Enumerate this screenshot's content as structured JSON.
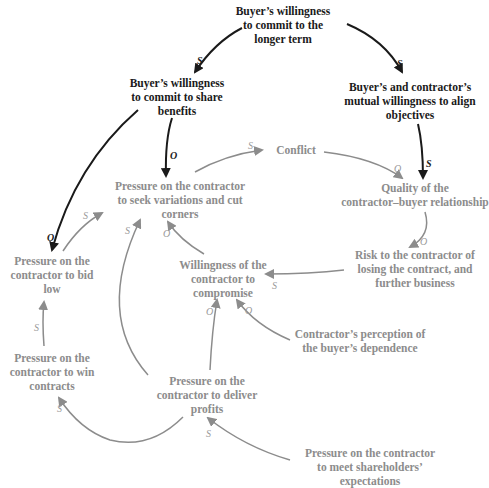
{
  "diagram": {
    "type": "causal-loop-diagram",
    "colors": {
      "dark": "#1a1a1a",
      "gray": "#8c8c8c"
    },
    "nodes": {
      "longer_term": "Buyer’s willingness to commit to the longer term",
      "share_benefits": "Buyer’s willingness to commit to share benefits",
      "align_objectives": "Buyer’s and contractor’s mutual willingness to align objectives",
      "conflict": "Conflict",
      "seek_variations": "Pressure on the contractor to seek variations and cut corners",
      "quality_relationship": "Quality of the contractor–buyer relationship",
      "risk_losing": "Risk to the contractor of losing the contract, and further business",
      "bid_low": "Pressure on the contractor to bid low",
      "willingness_compromise": "Willingness of the contractor to compromise",
      "perception_dependence": "Contractor’s perception of the buyer’s dependence",
      "win_contracts": "Pressure on the contractor to win contracts",
      "deliver_profits": "Pressure on the contractor to deliver profits",
      "shareholders": "Pressure on the contractor to meet shareholders’ expectations"
    },
    "node_lines": {
      "longer_term": [
        "Buyer’s willingness",
        "to commit to the",
        "longer term"
      ],
      "share_benefits": [
        "Buyer’s willingness",
        "to commit to share",
        "benefits"
      ],
      "align_objectives": [
        "Buyer’s and contractor’s",
        "mutual willingness to align",
        "objectives"
      ],
      "conflict": [
        "Conflict"
      ],
      "seek_variations": [
        "Pressure on the contractor",
        "to seek variations and cut",
        "corners"
      ],
      "quality_relationship": [
        "Quality of the",
        "contractor–buyer relationship"
      ],
      "risk_losing": [
        "Risk to the contractor of",
        "losing the contract, and",
        "further business"
      ],
      "bid_low": [
        "Pressure on the",
        "contractor to bid",
        "low"
      ],
      "willingness_compromise": [
        "Willingness of the",
        "contractor to",
        "compromise"
      ],
      "perception_dependence": [
        "Contractor’s perception of",
        "the buyer’s dependence"
      ],
      "win_contracts": [
        "Pressure on the",
        "contractor to win",
        "contracts"
      ],
      "deliver_profits": [
        "Pressure on the",
        "contractor to deliver",
        "profits"
      ],
      "shareholders": [
        "Pressure on the contractor",
        "to meet shareholders’",
        "expectations"
      ]
    },
    "links": [
      {
        "from": "longer_term",
        "to": "share_benefits",
        "polarity": "s"
      },
      {
        "from": "longer_term",
        "to": "align_objectives",
        "polarity": "s"
      },
      {
        "from": "share_benefits",
        "to": "seek_variations",
        "polarity": "o"
      },
      {
        "from": "share_benefits",
        "to": "bid_low",
        "polarity": "o"
      },
      {
        "from": "align_objectives",
        "to": "quality_relationship",
        "polarity": "s"
      },
      {
        "from": "seek_variations",
        "to": "conflict",
        "polarity": "s"
      },
      {
        "from": "conflict",
        "to": "quality_relationship",
        "polarity": "o"
      },
      {
        "from": "quality_relationship",
        "to": "risk_losing",
        "polarity": "o"
      },
      {
        "from": "risk_losing",
        "to": "willingness_compromise",
        "polarity": "s"
      },
      {
        "from": "willingness_compromise",
        "to": "seek_variations",
        "polarity": "o"
      },
      {
        "from": "bid_low",
        "to": "seek_variations",
        "polarity": "s"
      },
      {
        "from": "win_contracts",
        "to": "bid_low",
        "polarity": "s"
      },
      {
        "from": "deliver_profits",
        "to": "seek_variations",
        "polarity": "s"
      },
      {
        "from": "deliver_profits",
        "to": "willingness_compromise",
        "polarity": "o"
      },
      {
        "from": "perception_dependence",
        "to": "willingness_compromise",
        "polarity": "o"
      },
      {
        "from": "deliver_profits",
        "to": "win_contracts",
        "polarity": "s"
      },
      {
        "from": "shareholders",
        "to": "deliver_profits",
        "polarity": "s"
      }
    ],
    "labels": {
      "s": "S",
      "o": "O"
    }
  }
}
